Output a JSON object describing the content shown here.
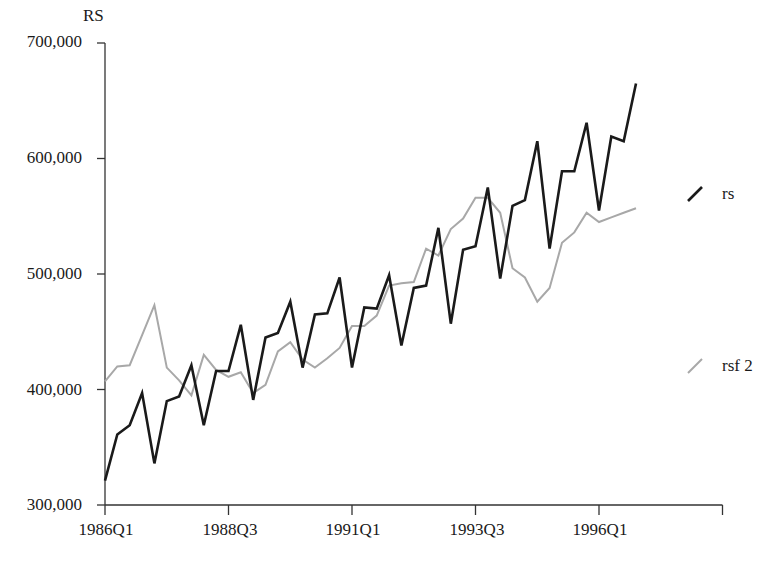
{
  "chart_data": {
    "type": "line",
    "title": "",
    "ylabel": "RS",
    "xlabel": "",
    "ylim": [
      300000,
      700000
    ],
    "yticks": [
      300000,
      400000,
      500000,
      600000,
      700000
    ],
    "ytick_labels": [
      "300,000",
      "400,000",
      "500,000",
      "600,000",
      "700,000"
    ],
    "xtick_labels": [
      "1986Q1",
      "1988Q3",
      "1991Q1",
      "1993Q3",
      "1996Q1"
    ],
    "xtick_positions": [
      0,
      10,
      20,
      30,
      40,
      50
    ],
    "grid": false,
    "legend_position": "right",
    "x": [
      "1986Q1",
      "1986Q2",
      "1986Q3",
      "1986Q4",
      "1987Q1",
      "1987Q2",
      "1987Q3",
      "1987Q4",
      "1988Q1",
      "1988Q2",
      "1988Q3",
      "1988Q4",
      "1989Q1",
      "1989Q2",
      "1989Q3",
      "1989Q4",
      "1990Q1",
      "1990Q2",
      "1990Q3",
      "1990Q4",
      "1991Q1",
      "1991Q2",
      "1991Q3",
      "1991Q4",
      "1992Q1",
      "1992Q2",
      "1992Q3",
      "1992Q4",
      "1993Q1",
      "1993Q2",
      "1993Q3",
      "1993Q4",
      "1994Q1",
      "1994Q2",
      "1994Q3",
      "1994Q4",
      "1995Q1",
      "1995Q2",
      "1995Q3",
      "1995Q4",
      "1996Q1",
      "1996Q2",
      "1996Q3",
      "1996Q4"
    ],
    "series": [
      {
        "name": "rs",
        "color": "#1a1a1a",
        "values": [
          321000,
          361000,
          369000,
          397000,
          336000,
          390000,
          394000,
          421000,
          369000,
          416000,
          416000,
          456000,
          391000,
          445000,
          449000,
          476000,
          419000,
          465000,
          466000,
          497000,
          419000,
          471000,
          470000,
          499000,
          438000,
          488000,
          490000,
          540000,
          457000,
          521000,
          524000,
          575000,
          496000,
          559000,
          564000,
          615000,
          522000,
          589000,
          589000,
          631000,
          555000,
          619000,
          615000,
          665000
        ]
      },
      {
        "name": "rsf 2",
        "color": "#a8a8a8",
        "values": [
          407000,
          420000,
          421000,
          447000,
          473000,
          419000,
          408000,
          395000,
          430000,
          417000,
          411000,
          415000,
          397000,
          404000,
          433000,
          441000,
          426000,
          419000,
          427000,
          436000,
          455000,
          455000,
          464000,
          490000,
          492000,
          493000,
          522000,
          516000,
          539000,
          548000,
          566000,
          566000,
          553000,
          505000,
          497000,
          476000,
          488000,
          527000,
          536000,
          553000,
          545000,
          549000,
          553000,
          557000
        ]
      }
    ]
  },
  "legend": {
    "items": [
      {
        "label": "rs",
        "color": "#1a1a1a"
      },
      {
        "label": "rsf 2",
        "color": "#a8a8a8"
      }
    ]
  },
  "axis": {
    "y_title": "RS"
  }
}
